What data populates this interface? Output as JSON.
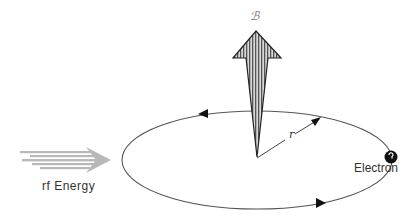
{
  "diagram": {
    "magnetic_field_label": "ℬ",
    "radius_label": "r",
    "rf_label": "rf Energy",
    "electron_label": "Electron"
  },
  "colors": {
    "line": "#555555",
    "arrow_fill": "#9a9a9a",
    "rf_arrow": "#b5b5b5",
    "electron": "#111111"
  }
}
